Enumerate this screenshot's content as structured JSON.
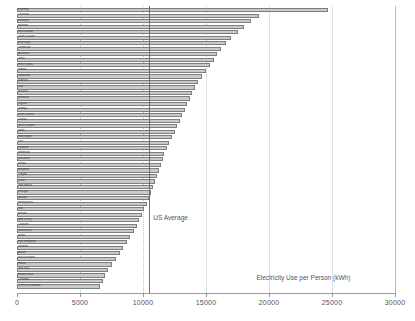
{
  "chart_data": {
    "type": "bar",
    "orientation": "horizontal",
    "title": "",
    "xlabel": "Electricity Use per Person (kWh)",
    "ylabel": "",
    "xlim": [
      0,
      30000
    ],
    "xticks": [
      0,
      5000,
      10000,
      15000,
      20000,
      25000,
      30000
    ],
    "xtick_labels": [
      "0",
      "5000",
      "10000",
      "15000",
      "20000",
      "25000",
      "30000"
    ],
    "grid": "vertical-dotted",
    "legend": "none",
    "annotations": [
      {
        "text": "US Average",
        "value": 10500,
        "type": "vertical-reference-line"
      }
    ],
    "categories": [
      "Wyoming",
      "Louisiana",
      "Kentucky",
      "Alabama",
      "North Dakota",
      "South Carolina",
      "Mississippi",
      "Tennessee",
      "Arkansas",
      "Texas",
      "West Virginia",
      "Indiana",
      "Oklahoma",
      "Montana",
      "Iowa",
      "Missouri",
      "Nebraska",
      "Virginia",
      "Georgia",
      "South Dakota",
      "Kansas",
      "North Carolina",
      "Idaho",
      "Washington",
      "Ohio",
      "Delaware",
      "Minnesota",
      "Wisconsin",
      "Florida",
      "Maryland",
      "Oregon",
      "Illinois",
      "New Mexico",
      "Michigan",
      "Nevada",
      "Pennsylvania",
      "Utah",
      "Arizona",
      "New Jersey",
      "Colorado",
      "Connecticut",
      "Maine",
      "New Hampshire",
      "Vermont",
      "Alaska",
      "Massachusetts",
      "Hawaii",
      "New York",
      "Rhode Island",
      "California",
      "District of Columbia"
    ],
    "values": [
      24700,
      19200,
      18600,
      18000,
      17500,
      17000,
      16600,
      16200,
      15900,
      15600,
      15300,
      15000,
      14700,
      14400,
      14100,
      13900,
      13700,
      13500,
      13300,
      13100,
      12900,
      12700,
      12500,
      12300,
      12100,
      11900,
      11700,
      11550,
      11400,
      11250,
      11100,
      10950,
      10800,
      10650,
      10500,
      10300,
      10100,
      9900,
      9700,
      9500,
      9250,
      9000,
      8750,
      8450,
      8150,
      7850,
      7550,
      7250,
      7000,
      6800,
      6550
    ]
  }
}
